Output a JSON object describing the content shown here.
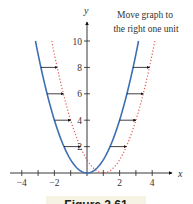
{
  "chart_data": {
    "type": "line",
    "title": "",
    "annotation": "Move graph to the right one unit",
    "xlabel": "x",
    "ylabel": "y",
    "xlim": [
      -4.5,
      4.8
    ],
    "ylim": [
      0,
      11
    ],
    "x_ticks": [
      -4,
      -3,
      -2,
      -1,
      1,
      2,
      3,
      4
    ],
    "x_tick_labels": [
      "−4",
      "−2",
      "2",
      "4"
    ],
    "x_tick_label_values": [
      -4,
      -2,
      2,
      4
    ],
    "y_ticks": [
      2,
      4,
      6,
      8,
      10
    ],
    "y_tick_labels": [
      "2",
      "4",
      "6",
      "8",
      "10"
    ],
    "grid": false,
    "series": [
      {
        "name": "y = x^2",
        "style": "solid",
        "color": "#3d6fb4",
        "x_range": [
          -3.162,
          3.162
        ]
      },
      {
        "name": "y = (x - 1)^2",
        "style": "dotted",
        "color": "#e05a5a",
        "x_range": [
          -2.162,
          4.162
        ]
      }
    ],
    "arrows": [
      {
        "y": 2,
        "from_x": -1.414,
        "to_x": -0.414
      },
      {
        "y": 4,
        "from_x": -2,
        "to_x": -1
      },
      {
        "y": 6,
        "from_x": -2.449,
        "to_x": -1.449
      },
      {
        "y": 8,
        "from_x": -2.828,
        "to_x": -1.828
      },
      {
        "y": 2,
        "from_x": 1.414,
        "to_x": 2.414
      },
      {
        "y": 4,
        "from_x": 2,
        "to_x": 3
      },
      {
        "y": 6,
        "from_x": 2.449,
        "to_x": 3.449
      },
      {
        "y": 8,
        "from_x": 2.828,
        "to_x": 3.828
      }
    ]
  },
  "labels": {
    "annotation_line1": "Move graph to",
    "annotation_line2": "the right one unit",
    "x_axis": "x",
    "y_axis": "y",
    "caption": "Figure 2.61"
  }
}
